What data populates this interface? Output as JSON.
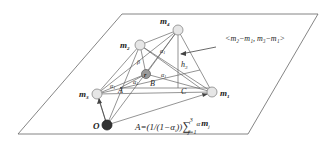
{
  "diagram": {
    "points": {
      "m1": {
        "label": "m",
        "sub": "1"
      },
      "m2": {
        "label": "m",
        "sub": "2"
      },
      "m3": {
        "label": "m",
        "sub": "3"
      },
      "m4": {
        "label": "m",
        "sub": "4"
      },
      "r": {
        "label": "r"
      },
      "O": {
        "label": "O"
      }
    },
    "labels": {
      "A": "A",
      "B": "B",
      "C": "C",
      "h": "h",
      "h_sub": "3",
      "alpha": "α",
      "alpha_sub": "1",
      "beta": "β"
    },
    "annotation": "<m₂−m₁, m₃−m₁>",
    "formula": {
      "lhs": "A=(1/(1−α",
      "lhs_sub": "i",
      "lhs_close": "))",
      "sum": "∑",
      "upper": "3",
      "lower": "j=1",
      "term": "α",
      "term2": "m",
      "term2_sub": "j"
    },
    "colors": {
      "line": "#555555",
      "node_fill": "#e6e6e6",
      "node_stroke": "#888888",
      "origin_fill": "#333333"
    }
  }
}
